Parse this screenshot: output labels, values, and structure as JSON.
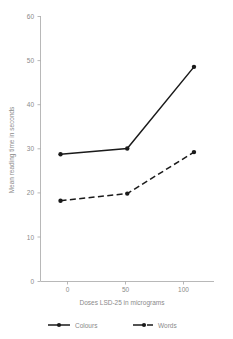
{
  "chart_data": {
    "type": "line",
    "title": "",
    "xlabel": "Doses LSD-25 in micrograms",
    "ylabel": "Mean reading time in seconds",
    "x": [
      0,
      50,
      100
    ],
    "xtick_labels": [
      "0",
      "50",
      "100"
    ],
    "ytick_labels": [
      "0",
      "10",
      "20",
      "30",
      "40",
      "50",
      "60"
    ],
    "ytick_values": [
      0,
      10,
      20,
      30,
      40,
      50,
      60
    ],
    "xlim": [
      -15,
      115
    ],
    "ylim": [
      0,
      60
    ],
    "grid": false,
    "legend_position": "bottom",
    "series": [
      {
        "name": "Colours",
        "values": [
          28.8,
          30.1,
          48.6
        ],
        "line_style": "solid",
        "color": "#1a1a1a",
        "marker": "circle"
      },
      {
        "name": "Words",
        "values": [
          18.3,
          19.9,
          29.3
        ],
        "line_style": "dashed",
        "color": "#1a1a1a",
        "marker": "circle"
      }
    ]
  },
  "legend": {
    "entries": [
      {
        "label": "Colours"
      },
      {
        "label": "Words"
      }
    ]
  },
  "axes": {
    "y_title": "Mean reading time in seconds",
    "x_title": "Doses LSD-25 in micrograms",
    "y_ticks": [
      "60",
      "50",
      "40",
      "30",
      "20",
      "10",
      "0"
    ],
    "x_ticks": [
      "0",
      "50",
      "100"
    ]
  },
  "colors": {
    "series": "#1a1a1a",
    "axis": "#a6a6a6",
    "text": "#8a8a8a",
    "background": "#ffffff"
  }
}
